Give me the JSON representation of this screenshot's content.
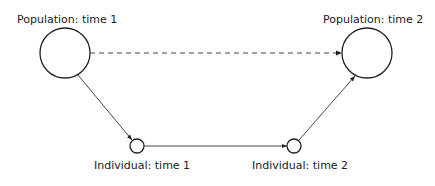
{
  "diagram": {
    "nodes": [
      {
        "id": "pop1",
        "label": "Population: time 1",
        "size": "large"
      },
      {
        "id": "pop2",
        "label": "Population: time 2",
        "size": "large"
      },
      {
        "id": "ind1",
        "label": "Individual: time 1",
        "size": "small"
      },
      {
        "id": "ind2",
        "label": "Individual: time 2",
        "size": "small"
      }
    ],
    "edges": [
      {
        "from": "pop1",
        "to": "pop2",
        "style": "dashed"
      },
      {
        "from": "pop1",
        "to": "ind1",
        "style": "solid"
      },
      {
        "from": "ind1",
        "to": "ind2",
        "style": "solid"
      },
      {
        "from": "ind2",
        "to": "pop2",
        "style": "solid"
      }
    ],
    "colors": {
      "stroke": "#222222",
      "dashed": "#444444"
    }
  }
}
